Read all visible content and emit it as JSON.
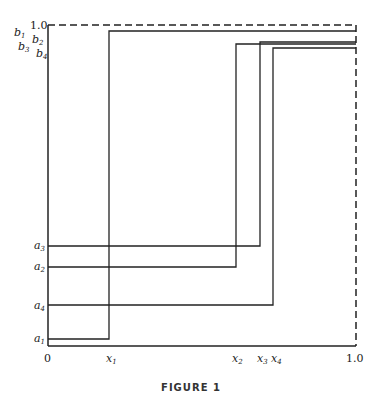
{
  "figure": {
    "caption": "FIGURE 1",
    "axis": {
      "x_origin_label": "0",
      "x_end_label": "1.0",
      "y_top_label": "1.0"
    },
    "x_labels": [
      {
        "var": "x",
        "sub": "1",
        "value": 0.198
      },
      {
        "var": "x",
        "sub": "2",
        "value": 0.61
      },
      {
        "var": "x",
        "sub": "3",
        "value": 0.688
      },
      {
        "var": "x",
        "sub": "4",
        "value": 0.73
      }
    ],
    "a_labels": [
      {
        "var": "a",
        "sub": "3",
        "value": 0.312
      },
      {
        "var": "a",
        "sub": "2",
        "value": 0.246
      },
      {
        "var": "a",
        "sub": "4",
        "value": 0.128
      },
      {
        "var": "a",
        "sub": "1",
        "value": 0.022
      }
    ],
    "b_labels": [
      {
        "var": "b",
        "sub": "1",
        "value": 0.981
      },
      {
        "var": "b",
        "sub": "2",
        "value": 0.941
      },
      {
        "var": "b",
        "sub": "3",
        "value": 0.947
      },
      {
        "var": "b",
        "sub": "4",
        "value": 0.928
      }
    ],
    "step_paths": [
      {
        "name": "path-1",
        "a": 0.022,
        "x": 0.198,
        "b": 0.981
      },
      {
        "name": "path-2",
        "a": 0.246,
        "x": 0.61,
        "b": 0.941
      },
      {
        "name": "path-3",
        "a": 0.312,
        "x": 0.688,
        "b": 0.947
      },
      {
        "name": "path-4",
        "a": 0.128,
        "x": 0.73,
        "b": 0.928
      }
    ],
    "colors": {
      "line": "#222222",
      "background": "#ffffff"
    }
  }
}
